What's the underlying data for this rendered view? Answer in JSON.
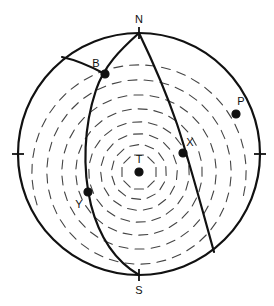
{
  "figure": {
    "name": "focal-mechanism-stereonet",
    "title": "",
    "background": "#ffffff",
    "stroke_color": "#111111",
    "tick_color": "#444444"
  },
  "chart_data": {
    "type": "scatter",
    "title": "",
    "subtitle": "",
    "xlabel": "",
    "ylabel": "",
    "projection": "lower-hemisphere-equal-area stereonet",
    "grid": false,
    "legend_position": "none",
    "axis_ranges": {
      "x": [
        -1,
        1
      ],
      "y": [
        -1,
        1
      ]
    },
    "primitive_circle": {
      "center_px": [
        139,
        154
      ],
      "radius_px": 121,
      "stroke_width": 2.2
    },
    "edge_ticks": [
      {
        "name": "north-tick",
        "angle_deg": 90,
        "label": "N"
      },
      {
        "name": "south-tick",
        "angle_deg": 270,
        "label": "S"
      },
      {
        "name": "west-tick",
        "angle_deg": 180,
        "label": ""
      },
      {
        "name": "east-tick",
        "angle_deg": 0,
        "label": ""
      }
    ],
    "axis_tick_labels": [
      "N",
      "S"
    ],
    "points": [
      {
        "label": "N",
        "name": "point-n",
        "x_px": 139,
        "y_px": 33,
        "label_x_px": 139,
        "label_y_px": 19,
        "marker": "tick",
        "filled": false
      },
      {
        "label": "S",
        "name": "point-s",
        "x_px": 139,
        "y_px": 275,
        "label_x_px": 139,
        "label_y_px": 290,
        "marker": "tick",
        "filled": false
      },
      {
        "label": "B",
        "name": "point-b",
        "x_px": 105,
        "y_px": 74,
        "label_x_px": 96,
        "label_y_px": 63,
        "marker": "circle",
        "filled": true
      },
      {
        "label": "P",
        "name": "point-p",
        "x_px": 236,
        "y_px": 114,
        "label_x_px": 241,
        "label_y_px": 101,
        "marker": "circle",
        "filled": true
      },
      {
        "label": "X",
        "name": "point-x",
        "x_px": 183,
        "y_px": 153,
        "label_x_px": 190,
        "label_y_px": 142,
        "marker": "circle",
        "filled": true
      },
      {
        "label": "T",
        "name": "point-t",
        "x_px": 139,
        "y_px": 172,
        "label_x_px": 139,
        "label_y_px": 159,
        "marker": "circle",
        "filled": true
      },
      {
        "label": "Y",
        "name": "point-y",
        "x_px": 88,
        "y_px": 192,
        "label_x_px": 79,
        "label_y_px": 204,
        "marker": "circle",
        "filled": true
      }
    ],
    "nodal_planes": [
      {
        "name": "nodal-plane-1",
        "description": "great circle arc from N through B and Y to S",
        "path": "M 139 33 C 120 50 104 66 96 90 C 84 126 82 168 91 205 C 100 240 117 262 139 275"
      },
      {
        "name": "nodal-plane-2",
        "description": "great circle arc from N through X to lower-right rim",
        "path": "M 139 33 C 152 60 166 92 177 124 C 189 160 201 205 214 252"
      },
      {
        "name": "auxiliary-arc",
        "description": "short arc from B to upper-left rim",
        "path": "M 105 74 C 92 67 76 60 62 57"
      }
    ],
    "hatching": {
      "name": "radial-tick-hatching",
      "center_px": [
        139,
        172
      ],
      "description": "short tangential dashes in concentric rings radiating about T",
      "ring_radii_px": [
        17,
        27,
        38,
        50,
        63,
        77,
        92,
        107
      ],
      "dash_length_px": 9,
      "stroke_width": 1.1
    }
  },
  "labels": {
    "n": "N",
    "s": "S",
    "b": "B",
    "p": "P",
    "x": "X",
    "t": "T",
    "y": "Y"
  }
}
